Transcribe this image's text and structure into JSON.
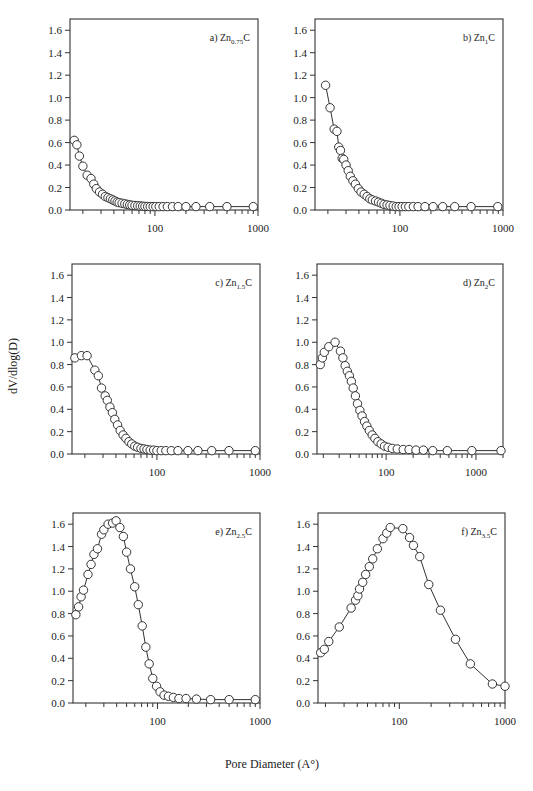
{
  "figure": {
    "xlabel": "Pore Diameter (A°)",
    "ylabel": "dV/dlog(D)"
  },
  "chart_data": [
    {
      "type": "scatter",
      "id": "a",
      "title": "a) Zn0.75C",
      "label_prefix": "a) Zn",
      "label_sub": "0.75",
      "label_suffix": "C",
      "xlabel": "Pore Diameter (A°)",
      "ylabel": "dV/dlog(D)",
      "xscale": "log",
      "xlim": [
        15,
        1000
      ],
      "ylim": [
        0,
        1.7
      ],
      "xticks": [
        100,
        1000
      ],
      "yticks": [
        0.0,
        0.2,
        0.4,
        0.6,
        0.8,
        1.0,
        1.2,
        1.4,
        1.6
      ],
      "grid": false,
      "x": [
        16.5,
        17.5,
        18.5,
        20,
        22,
        24,
        25.5,
        27,
        29,
        31,
        33,
        35,
        37,
        39,
        41,
        43,
        45,
        48,
        51,
        54,
        57,
        60,
        64,
        68,
        72,
        76,
        80,
        85,
        90,
        96,
        102,
        110,
        120,
        132,
        148,
        168,
        200,
        250,
        340,
        500,
        900
      ],
      "y": [
        0.62,
        0.58,
        0.48,
        0.39,
        0.31,
        0.28,
        0.23,
        0.19,
        0.16,
        0.14,
        0.12,
        0.11,
        0.1,
        0.09,
        0.08,
        0.07,
        0.065,
        0.06,
        0.055,
        0.05,
        0.045,
        0.042,
        0.04,
        0.038,
        0.036,
        0.034,
        0.032,
        0.031,
        0.03,
        0.03,
        0.03,
        0.03,
        0.03,
        0.03,
        0.03,
        0.03,
        0.03,
        0.03,
        0.03,
        0.03,
        0.03
      ]
    },
    {
      "type": "scatter",
      "id": "b",
      "title": "b) Zn1C",
      "label_prefix": "b) Zn",
      "label_sub": "1",
      "label_suffix": "C",
      "xlabel": "Pore Diameter (A°)",
      "ylabel": "dV/dlog(D)",
      "xscale": "log",
      "xlim": [
        15,
        1000
      ],
      "ylim": [
        0,
        1.7
      ],
      "xticks": [
        100,
        1000
      ],
      "yticks": [
        0.0,
        0.2,
        0.4,
        0.6,
        0.8,
        1.0,
        1.2,
        1.4,
        1.6
      ],
      "grid": false,
      "x": [
        19,
        21,
        23,
        24.5,
        25.5,
        26.5,
        27.5,
        28.5,
        30,
        31.5,
        33,
        35,
        37,
        39.5,
        42,
        45,
        48,
        51,
        54,
        58,
        62,
        66,
        70,
        75,
        80,
        86,
        92,
        98,
        105,
        113,
        122,
        135,
        150,
        175,
        210,
        260,
        340,
        490,
        890
      ],
      "y": [
        1.11,
        0.91,
        0.72,
        0.7,
        0.56,
        0.53,
        0.46,
        0.45,
        0.4,
        0.35,
        0.3,
        0.26,
        0.23,
        0.19,
        0.16,
        0.14,
        0.12,
        0.1,
        0.09,
        0.08,
        0.07,
        0.06,
        0.05,
        0.045,
        0.04,
        0.035,
        0.03,
        0.03,
        0.03,
        0.03,
        0.03,
        0.03,
        0.03,
        0.03,
        0.03,
        0.03,
        0.03,
        0.03,
        0.03
      ]
    },
    {
      "type": "scatter",
      "id": "c",
      "title": "c) Zn1.5C",
      "label_prefix": "c) Zn",
      "label_sub": "1.5",
      "label_suffix": "C",
      "xlabel": "Pore Diameter (A°)",
      "ylabel": "dV/dlog(D)",
      "xscale": "log",
      "xlim": [
        15,
        1000
      ],
      "ylim": [
        0,
        1.7
      ],
      "xticks": [
        100,
        1000
      ],
      "yticks": [
        0.0,
        0.2,
        0.4,
        0.6,
        0.8,
        1.0,
        1.2,
        1.4,
        1.6
      ],
      "grid": false,
      "x": [
        16,
        18.5,
        21,
        25,
        27,
        29,
        31.5,
        33,
        35,
        37,
        39,
        41.5,
        44,
        47,
        50,
        53.5,
        57,
        61,
        65,
        70,
        75,
        80,
        86,
        93,
        100,
        110,
        122,
        138,
        160,
        200,
        250,
        340,
        500,
        900
      ],
      "y": [
        0.86,
        0.88,
        0.88,
        0.75,
        0.7,
        0.59,
        0.52,
        0.48,
        0.42,
        0.37,
        0.31,
        0.26,
        0.21,
        0.17,
        0.14,
        0.11,
        0.09,
        0.07,
        0.06,
        0.05,
        0.045,
        0.04,
        0.035,
        0.035,
        0.03,
        0.03,
        0.03,
        0.03,
        0.03,
        0.03,
        0.03,
        0.03,
        0.03,
        0.03
      ]
    },
    {
      "type": "scatter",
      "id": "d",
      "title": "d) Zn2C",
      "label_prefix": "d) Zn",
      "label_sub": "2",
      "label_suffix": "C",
      "xlabel": "Pore Diameter (A°)",
      "ylabel": "dV/dlog(D)",
      "xscale": "log",
      "xlim": [
        17,
        2000
      ],
      "ylim": [
        0,
        1.7
      ],
      "xticks": [
        100,
        1000
      ],
      "yticks": [
        0.0,
        0.2,
        0.4,
        0.6,
        0.8,
        1.0,
        1.2,
        1.4,
        1.6
      ],
      "grid": false,
      "x": [
        18.5,
        19.5,
        20.5,
        23,
        27,
        31,
        33,
        35,
        37,
        39,
        41,
        43,
        45.5,
        48,
        51,
        54,
        57.5,
        61,
        65,
        70,
        75,
        81,
        88,
        96,
        105,
        117,
        133,
        155,
        180,
        215,
        260,
        330,
        480,
        900,
        1900
      ],
      "y": [
        0.8,
        0.86,
        0.91,
        0.96,
        1.0,
        0.92,
        0.86,
        0.79,
        0.74,
        0.7,
        0.65,
        0.59,
        0.52,
        0.45,
        0.39,
        0.34,
        0.29,
        0.25,
        0.21,
        0.17,
        0.14,
        0.11,
        0.09,
        0.07,
        0.06,
        0.05,
        0.045,
        0.04,
        0.04,
        0.035,
        0.035,
        0.03,
        0.03,
        0.03,
        0.03
      ]
    },
    {
      "type": "scatter",
      "id": "e",
      "title": "e) Zn2.5C",
      "label_prefix": "e) Zn",
      "label_sub": "2.5",
      "label_suffix": "C",
      "xlabel": "Pore Diameter (A°)",
      "ylabel": "dV/dlog(D)",
      "xscale": "log",
      "xlim": [
        15,
        1000
      ],
      "ylim": [
        0,
        1.7
      ],
      "xticks": [
        100,
        1000
      ],
      "yticks": [
        0.0,
        0.2,
        0.4,
        0.6,
        0.8,
        1.0,
        1.2,
        1.4,
        1.6
      ],
      "grid": false,
      "x": [
        16,
        17,
        18,
        19,
        21,
        22.5,
        24,
        26,
        28.5,
        30,
        33,
        36.5,
        39.5,
        43,
        46.5,
        50,
        54.5,
        60,
        65,
        71,
        77,
        83,
        90,
        98,
        106,
        116,
        128,
        143,
        162,
        190,
        240,
        330,
        500,
        900
      ],
      "y": [
        0.79,
        0.86,
        0.95,
        1.01,
        1.15,
        1.24,
        1.33,
        1.38,
        1.51,
        1.55,
        1.6,
        1.61,
        1.63,
        1.57,
        1.49,
        1.35,
        1.2,
        1.04,
        0.88,
        0.69,
        0.5,
        0.35,
        0.22,
        0.15,
        0.1,
        0.07,
        0.06,
        0.05,
        0.04,
        0.04,
        0.035,
        0.03,
        0.03,
        0.03
      ]
    },
    {
      "type": "scatter",
      "id": "f",
      "title": "f) Zn3.5C",
      "label_prefix": "f) Zn",
      "label_sub": "3.5",
      "label_suffix": "C",
      "xlabel": "Pore Diameter (A°)",
      "ylabel": "dV/dlog(D)",
      "xscale": "log",
      "xlim": [
        17,
        1000
      ],
      "ylim": [
        0,
        1.7
      ],
      "xticks": [
        100,
        1000
      ],
      "yticks": [
        0.0,
        0.2,
        0.4,
        0.6,
        0.8,
        1.0,
        1.2,
        1.4,
        1.6
      ],
      "grid": false,
      "x": [
        18,
        19.5,
        21.5,
        27,
        35,
        38.5,
        40.5,
        42,
        45,
        48,
        52,
        56,
        62,
        70,
        76,
        82,
        108,
        125,
        136,
        156,
        190,
        245,
        340,
        470,
        760,
        1000
      ],
      "y": [
        0.45,
        0.48,
        0.55,
        0.68,
        0.85,
        0.92,
        0.96,
        1.02,
        1.08,
        1.15,
        1.22,
        1.29,
        1.38,
        1.47,
        1.52,
        1.57,
        1.56,
        1.48,
        1.41,
        1.31,
        1.06,
        0.83,
        0.57,
        0.35,
        0.17,
        0.15
      ]
    }
  ]
}
